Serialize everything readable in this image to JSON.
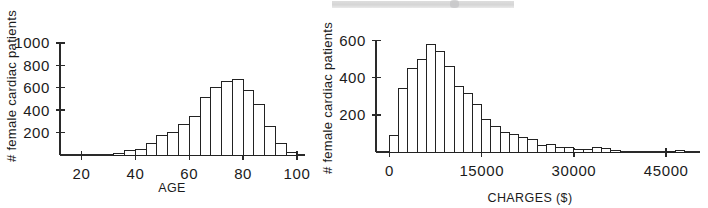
{
  "page": {
    "background": "#ffffff",
    "ink": "#1b1b1b",
    "scan_artifact_color": "#d4d4d4"
  },
  "chart_data": [
    {
      "id": "age-histogram",
      "type": "bar",
      "title": "",
      "xlabel": "AGE",
      "ylabel": "# female cardiac patients",
      "xlim": [
        12,
        103
      ],
      "ylim": [
        0,
        1080
      ],
      "xticks": [
        20,
        40,
        60,
        80,
        100
      ],
      "xtick_labels": [
        "20",
        "40",
        "60",
        "80",
        "100"
      ],
      "yticks": [
        200,
        400,
        600,
        800,
        1000
      ],
      "ytick_labels": [
        "200",
        "400",
        "600",
        "800",
        "1000"
      ],
      "grid": false,
      "legend": "none",
      "bin_width": 4,
      "bin_starts": [
        32,
        36,
        40,
        44,
        48,
        52,
        56,
        60,
        64,
        68,
        72,
        76,
        80,
        84,
        88,
        92,
        96
      ],
      "categories": [
        "32-36",
        "36-40",
        "40-44",
        "44-48",
        "48-52",
        "52-56",
        "56-60",
        "60-64",
        "64-68",
        "68-72",
        "72-76",
        "76-80",
        "80-84",
        "84-88",
        "88-92",
        "92-96",
        "96-100"
      ],
      "values": [
        10,
        40,
        45,
        105,
        175,
        200,
        270,
        345,
        510,
        600,
        660,
        670,
        580,
        450,
        255,
        105,
        25
      ]
    },
    {
      "id": "charges-histogram",
      "type": "bar",
      "title": "",
      "xlabel": "CHARGES ($)",
      "ylabel": "# female cardiac patients",
      "xlim": [
        -2200,
        50500
      ],
      "ylim": [
        0,
        640
      ],
      "xticks": [
        0,
        15000,
        30000,
        45000
      ],
      "xtick_labels": [
        "0",
        "15000",
        "30000",
        "45000"
      ],
      "yticks": [
        200,
        400,
        600
      ],
      "ytick_labels": [
        "200",
        "400",
        "600"
      ],
      "grid": false,
      "legend": "none",
      "bin_width": 1500,
      "bin_starts": [
        0,
        1500,
        3000,
        4500,
        6000,
        7500,
        9000,
        10500,
        12000,
        13500,
        15000,
        16500,
        18000,
        19500,
        21000,
        22500,
        24000,
        25500,
        27000,
        28500,
        30000,
        31500,
        33000,
        34500,
        36000,
        45000,
        46500
      ],
      "categories": [
        "0-1500",
        "1500-3000",
        "3000-4500",
        "4500-6000",
        "6000-7500",
        "7500-9000",
        "9000-10500",
        "10500-12000",
        "12000-13500",
        "13500-15000",
        "15000-16500",
        "16500-18000",
        "18000-19500",
        "19500-21000",
        "21000-22500",
        "22500-24000",
        "24000-25500",
        "25500-27000",
        "27000-28500",
        "28500-30000",
        "30000-31500",
        "31500-33000",
        "33000-34500",
        "34500-36000",
        "36000-37500",
        "45000-46500",
        "46500-48000"
      ],
      "values": [
        90,
        340,
        447,
        497,
        580,
        543,
        462,
        353,
        312,
        253,
        176,
        136,
        107,
        92,
        80,
        68,
        36,
        42,
        26,
        24,
        14,
        16,
        26,
        18,
        6,
        4,
        6
      ]
    }
  ]
}
